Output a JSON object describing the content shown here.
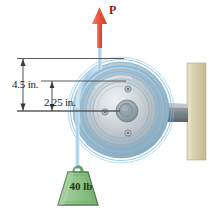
{
  "figure": {
    "name": "pulley-bracket-free-body-diagram",
    "background_color": "#ffffff",
    "width": 218,
    "height": 213
  },
  "dimensions": [
    {
      "id": "outer-radius",
      "label": "4.5 in.",
      "value": 4.5,
      "unit": "in.",
      "measures": "outer pulley radius"
    },
    {
      "id": "inner-radius",
      "label": "2.25 in.",
      "value": 2.25,
      "unit": "in.",
      "measures": "inner hub radius"
    }
  ],
  "forces": [
    {
      "id": "applied-force",
      "label": "P",
      "direction": "up",
      "color": "#e8563c",
      "label_color": "#8d2118"
    },
    {
      "id": "hanging-load",
      "label": "40 lb",
      "value": 40,
      "unit": "lb",
      "direction": "down",
      "color": "#8fc08a"
    }
  ],
  "components": {
    "pulley": {
      "name": "pulley-wheel",
      "color_outer": "#9fb8c6",
      "color_rim": "#b9cdd8",
      "color_hub": "#cdd6da",
      "highlight": "#5fa8d8",
      "bolt_count": 3
    },
    "shaft": {
      "name": "support-shaft",
      "color": "#8f9aa0"
    },
    "wall": {
      "name": "wall-plate",
      "color": "#d8cfae"
    },
    "cable": {
      "name": "cable-rope",
      "color": "#aad2ec"
    },
    "weight_block": {
      "name": "weight-block",
      "fill": "#9ccb95",
      "stroke": "#4f7d4c"
    }
  },
  "colors": {
    "dimension_line": "#5b5b5b",
    "text": "#1a1a1a"
  }
}
